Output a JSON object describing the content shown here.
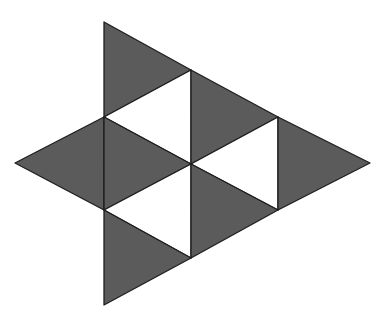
{
  "diagram": {
    "colors": {
      "fill_dark": "#5b5b5b",
      "fill_light": "#ffffff",
      "stroke": "#1e1e1e",
      "background": "#ffffff"
    },
    "vertices": {
      "A": [
        104,
        22
      ],
      "B": [
        191,
        70
      ],
      "C": [
        104,
        117
      ],
      "D": [
        278,
        117
      ],
      "E": [
        15,
        163
      ],
      "F": [
        191,
        164
      ],
      "G": [
        370,
        163
      ],
      "H": [
        104,
        210
      ],
      "I": [
        278,
        210
      ],
      "J": [
        191,
        258
      ],
      "K": [
        104,
        305
      ]
    },
    "triangles": [
      {
        "name": "top",
        "points": [
          "A",
          "B",
          "C"
        ],
        "shade": "dark"
      },
      {
        "name": "upper-inner",
        "points": [
          "C",
          "B",
          "F"
        ],
        "shade": "light"
      },
      {
        "name": "upper-right",
        "points": [
          "B",
          "D",
          "F"
        ],
        "shade": "dark"
      },
      {
        "name": "right-inner",
        "points": [
          "F",
          "D",
          "I"
        ],
        "shade": "light"
      },
      {
        "name": "right-tip",
        "points": [
          "D",
          "G",
          "I"
        ],
        "shade": "dark"
      },
      {
        "name": "left-tip",
        "points": [
          "E",
          "C",
          "H"
        ],
        "shade": "dark"
      },
      {
        "name": "center-left",
        "points": [
          "C",
          "F",
          "H"
        ],
        "shade": "dark"
      },
      {
        "name": "lower-inner",
        "points": [
          "H",
          "F",
          "J"
        ],
        "shade": "light"
      },
      {
        "name": "lower-right",
        "points": [
          "F",
          "I",
          "J"
        ],
        "shade": "dark"
      },
      {
        "name": "bottom",
        "points": [
          "H",
          "J",
          "K"
        ],
        "shade": "dark"
      }
    ]
  }
}
